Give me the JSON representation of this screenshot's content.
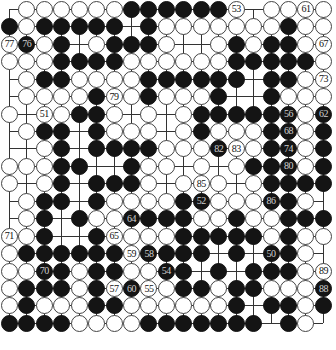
{
  "diagram": {
    "type": "go-board",
    "size": 19,
    "colors": {
      "black": "#141414",
      "white": "#ffffff",
      "line": "#333333"
    },
    "rows": [
      ".WWWWWWBBBBBBW.WWWW",
      "BWBBBBB.BWWWWWWWBWW",
      "WBWB.WBBBW..WBWBBWW",
      "WWWBBBBWWWWWWBBBBBW",
      ".WBBWWWWBBBBBB.BBWW",
      ".WWWWBWWBWWWB..BWWW",
      "W.WWBBW.W.WBBBBBBWB",
      ".WBB.BWWW.WBWWWBBWB",
      "..WB.BBBBWWWBWWBBWB",
      "WWWBB..BWW.W.WBBBWB",
      "W.WB.BBBW.WWW.WBBBB",
      ".WBB.BWWWWBBWWWBBW.",
      ".WB.BWWBBBBWWBWWBBB",
      "WWB..BWWWWBBBBBWBWW",
      "WBBBBBBWBBBB.B.BBW.",
      "WWBBWBBWWBB.B.BBBWW",
      "WBBBWBWBWWBBWBBWWWB",
      "WBWWWBBWWWWWWB.BBWB",
      "BBBBWWWWBBBBBBB.BW."
    ],
    "move_labels": [
      {
        "row": 1,
        "col": 14,
        "color": "W",
        "label": "53"
      },
      {
        "row": 1,
        "col": 18,
        "color": "W",
        "label": "61"
      },
      {
        "row": 3,
        "col": 1,
        "color": "W",
        "label": "77"
      },
      {
        "row": 3,
        "col": 2,
        "color": "B",
        "label": "76"
      },
      {
        "row": 3,
        "col": 19,
        "color": "W",
        "label": "67"
      },
      {
        "row": 5,
        "col": 19,
        "color": "W",
        "label": "73"
      },
      {
        "row": 6,
        "col": 7,
        "color": "W",
        "label": "79"
      },
      {
        "row": 7,
        "col": 3,
        "color": "W",
        "label": "51"
      },
      {
        "row": 7,
        "col": 17,
        "color": "B",
        "label": "56"
      },
      {
        "row": 7,
        "col": 19,
        "color": "B",
        "label": "62"
      },
      {
        "row": 8,
        "col": 17,
        "color": "B",
        "label": "68"
      },
      {
        "row": 9,
        "col": 13,
        "color": "B",
        "label": "82"
      },
      {
        "row": 9,
        "col": 14,
        "color": "W",
        "label": "83"
      },
      {
        "row": 9,
        "col": 17,
        "color": "B",
        "label": "74"
      },
      {
        "row": 10,
        "col": 17,
        "color": "B",
        "label": "80"
      },
      {
        "row": 11,
        "col": 12,
        "color": "W",
        "label": "85"
      },
      {
        "row": 12,
        "col": 12,
        "color": "B",
        "label": "52"
      },
      {
        "row": 12,
        "col": 16,
        "color": "B",
        "label": "86"
      },
      {
        "row": 13,
        "col": 8,
        "color": "B",
        "label": "64"
      },
      {
        "row": 14,
        "col": 1,
        "color": "W",
        "label": "71"
      },
      {
        "row": 14,
        "col": 7,
        "color": "W",
        "label": "65"
      },
      {
        "row": 15,
        "col": 8,
        "color": "W",
        "label": "59"
      },
      {
        "row": 15,
        "col": 9,
        "color": "B",
        "label": "58"
      },
      {
        "row": 15,
        "col": 16,
        "color": "B",
        "label": "50"
      },
      {
        "row": 16,
        "col": 3,
        "color": "B",
        "label": "70"
      },
      {
        "row": 16,
        "col": 10,
        "color": "B",
        "label": "54"
      },
      {
        "row": 16,
        "col": 19,
        "color": "W",
        "label": "89"
      },
      {
        "row": 17,
        "col": 7,
        "color": "W",
        "label": "57"
      },
      {
        "row": 17,
        "col": 8,
        "color": "B",
        "label": "60"
      },
      {
        "row": 17,
        "col": 9,
        "color": "W",
        "label": "55"
      },
      {
        "row": 17,
        "col": 19,
        "color": "B",
        "label": "88"
      }
    ]
  },
  "caption": {
    "text": ""
  }
}
